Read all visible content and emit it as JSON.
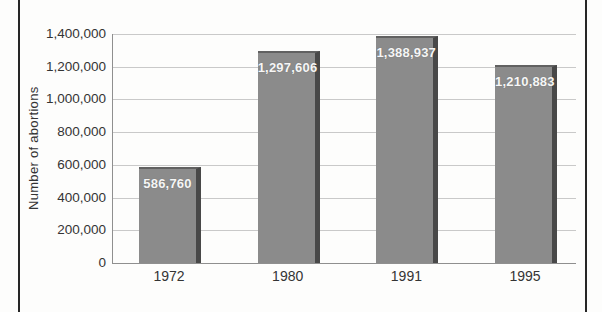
{
  "figure": {
    "background_color": "#fdfdfc",
    "page_rule_color": "#262626"
  },
  "chart_data": {
    "type": "bar",
    "categories": [
      "1972",
      "1980",
      "1991",
      "1995"
    ],
    "values": [
      586760,
      1297606,
      1388937,
      1210883
    ],
    "value_labels": [
      "586,760",
      "1,297,606",
      "1,388,937",
      "1,210,883"
    ],
    "title": "",
    "xlabel": "",
    "ylabel": "Number of abortions",
    "ylim": [
      0,
      1400000
    ],
    "ytick_step": 200000,
    "ytick_labels": [
      "0",
      "200,000",
      "400,000",
      "600,000",
      "800,000",
      "1,000,000",
      "1,200,000",
      "1,400,000"
    ],
    "grid": true,
    "legend": "none",
    "bar_color": "#8b8b8b",
    "bar_edge_color": "#484848",
    "bar_top_edge_color": "#616161",
    "gridline_color": "#c9c9c9",
    "axis_color": "#8f8f8f",
    "tick_label_color": "#343434",
    "bar_label_color": "#f6f6f6"
  }
}
